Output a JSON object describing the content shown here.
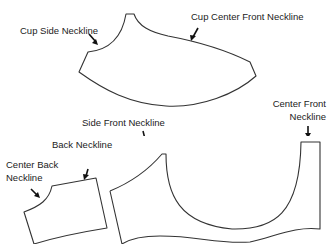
{
  "diagram": {
    "labels": {
      "cup_side_neckline": "Cup Side Neckline",
      "cup_center_front_neckline": "Cup Center Front Neckline",
      "center_front_neckline_line1": "Center Front",
      "center_front_neckline_line2": "Neckline",
      "side_front_neckline": "Side Front Neckline",
      "back_neckline": "Back Neckline",
      "center_back_neckline_line1": "Center Back",
      "center_back_neckline_line2": "Neckline"
    },
    "pieces": [
      "cup",
      "center-back-piece",
      "front-band"
    ],
    "colors": {
      "outline": "#333333",
      "arrow": "#111111",
      "text": "#222222",
      "background": "#ffffff"
    }
  }
}
